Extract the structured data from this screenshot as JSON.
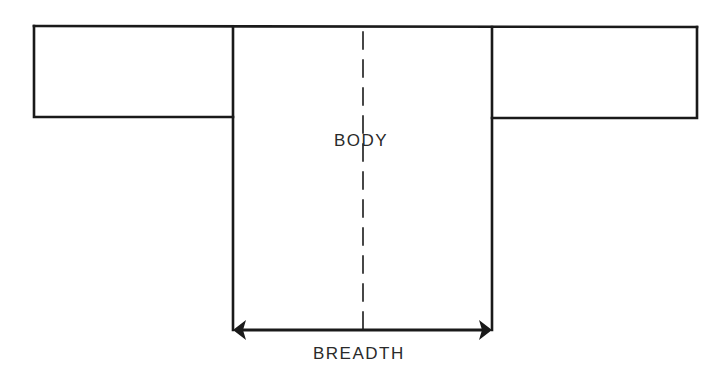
{
  "diagram": {
    "type": "garment-pattern",
    "labels": {
      "body": "BODY",
      "breadth": "BREADTH"
    },
    "parts": [
      {
        "name": "left-sleeve",
        "shape": "rectangle"
      },
      {
        "name": "body",
        "shape": "rectangle"
      },
      {
        "name": "right-sleeve",
        "shape": "rectangle"
      }
    ],
    "annotations": [
      {
        "name": "center-fold-line",
        "style": "dashed",
        "orientation": "vertical"
      },
      {
        "name": "breadth-dimension-arrow",
        "style": "double-headed",
        "orientation": "horizontal",
        "label": "BREADTH"
      }
    ],
    "colors": {
      "stroke": "#1a1a1a",
      "background": "#ffffff",
      "text": "#2a2a2a"
    }
  }
}
